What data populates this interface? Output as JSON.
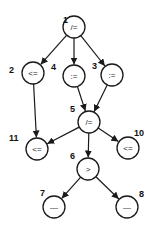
{
  "diagram": {
    "type": "directed-graph",
    "node_radius": 11,
    "nodes": [
      {
        "id": "1",
        "op": "/=",
        "x": 74,
        "y": 27,
        "label_x": 63,
        "label_y": 20
      },
      {
        "id": "2",
        "op": "<=",
        "x": 33,
        "y": 73,
        "label_x": 9,
        "label_y": 70
      },
      {
        "id": "4",
        "op": ":=",
        "x": 74,
        "y": 76,
        "label_x": 51,
        "label_y": 67
      },
      {
        "id": "3",
        "op": ":=",
        "x": 112,
        "y": 75,
        "label_x": 92,
        "label_y": 66
      },
      {
        "id": "5",
        "op": "/=",
        "x": 89,
        "y": 122,
        "label_x": 70,
        "label_y": 109
      },
      {
        "id": "11",
        "op": "<=",
        "x": 37,
        "y": 149,
        "label_x": 9,
        "label_y": 138
      },
      {
        "id": "10",
        "op": "<=",
        "x": 128,
        "y": 148,
        "label_x": 134,
        "label_y": 133
      },
      {
        "id": "6",
        "op": ">",
        "x": 88,
        "y": 169,
        "label_x": 70,
        "label_y": 156
      },
      {
        "id": "7",
        "op": "—",
        "x": 54,
        "y": 207,
        "label_x": 40,
        "label_y": 193
      },
      {
        "id": "8",
        "op": "—",
        "x": 127,
        "y": 207,
        "label_x": 139,
        "label_y": 194
      }
    ],
    "edges": [
      {
        "from": "1",
        "to": "2"
      },
      {
        "from": "1",
        "to": "4"
      },
      {
        "from": "1",
        "to": "3"
      },
      {
        "from": "2",
        "to": "11"
      },
      {
        "from": "4",
        "to": "5"
      },
      {
        "from": "3",
        "to": "5"
      },
      {
        "from": "5",
        "to": "11"
      },
      {
        "from": "5",
        "to": "6"
      },
      {
        "from": "5",
        "to": "10"
      },
      {
        "from": "6",
        "to": "7"
      },
      {
        "from": "6",
        "to": "8"
      }
    ],
    "colors": {
      "stroke": "#1a1a1a",
      "background": "#ffffff"
    }
  }
}
